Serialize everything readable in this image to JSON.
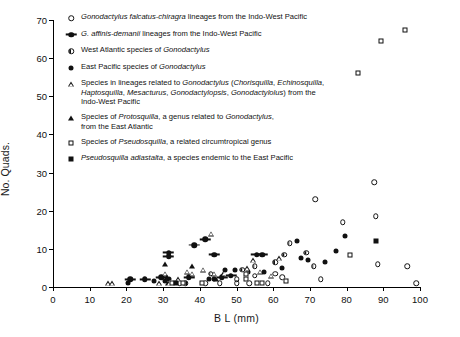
{
  "chart_data": {
    "type": "scatter",
    "title": "",
    "xlabel": "B L (mm)",
    "ylabel": "No. Quads.",
    "xlim": [
      0,
      100
    ],
    "ylim": [
      0,
      70
    ],
    "xticks": [
      0,
      10,
      20,
      30,
      40,
      50,
      60,
      70,
      80,
      90,
      100
    ],
    "yticks": [
      0,
      10,
      20,
      30,
      40,
      50,
      60,
      70
    ],
    "grid": false,
    "legend_position": "upper-left-inside",
    "series": [
      {
        "name": "Gonodactylus falcatus-chiragra lineages from the Indo-West Pacific",
        "marker": "open-circle",
        "points": [
          [
            34.5,
            1.0
          ],
          [
            36.0,
            1.0
          ],
          [
            41.5,
            1.0
          ],
          [
            45.5,
            1.0
          ],
          [
            50.0,
            2.0
          ],
          [
            50.0,
            1.0
          ],
          [
            53.5,
            1.0
          ],
          [
            58.5,
            1.0
          ],
          [
            55.0,
            3.0
          ],
          [
            60.5,
            3.5
          ],
          [
            62.5,
            2.5
          ],
          [
            71.5,
            23.0
          ],
          [
            73.0,
            2.0
          ],
          [
            79.0,
            17.0
          ],
          [
            87.5,
            27.5
          ],
          [
            88.0,
            18.5
          ],
          [
            88.5,
            6.0
          ],
          [
            96.5,
            5.5
          ],
          [
            99.0,
            1.0
          ]
        ]
      },
      {
        "name": "G. affinis-demanii lineages from the Indo-West Pacific",
        "marker": "barred-circle",
        "points": [
          [
            21.0,
            2.0
          ],
          [
            25.0,
            2.0
          ],
          [
            29.5,
            2.5
          ],
          [
            31.5,
            8.0
          ],
          [
            31.5,
            9.0
          ],
          [
            37.0,
            2.5
          ],
          [
            38.5,
            11.0
          ],
          [
            41.5,
            12.5
          ],
          [
            44.0,
            8.5
          ],
          [
            46.0,
            2.5
          ],
          [
            48.5,
            3.0
          ],
          [
            55.5,
            8.5
          ],
          [
            57.0,
            8.5
          ]
        ]
      },
      {
        "name": "West Atlantic species of Gonodactylus",
        "marker": "half-circle",
        "points": [
          [
            43.0,
            3.5
          ],
          [
            51.5,
            4.5
          ],
          [
            55.0,
            5.5
          ],
          [
            60.5,
            6.5
          ],
          [
            63.0,
            8.5
          ],
          [
            64.5,
            11.5
          ],
          [
            69.0,
            9.0
          ],
          [
            71.0,
            5.5
          ]
        ]
      },
      {
        "name": "East Pacific species of Gonodactylus",
        "marker": "filled-circle",
        "points": [
          [
            20.5,
            1.0
          ],
          [
            27.5,
            1.5
          ],
          [
            30.5,
            1.5
          ],
          [
            31.5,
            2.0
          ],
          [
            36.0,
            1.0
          ],
          [
            42.5,
            2.0
          ],
          [
            44.0,
            2.0
          ],
          [
            47.0,
            4.5
          ],
          [
            49.5,
            4.5
          ],
          [
            53.0,
            4.0
          ],
          [
            57.5,
            4.0
          ],
          [
            62.5,
            5.0
          ],
          [
            66.5,
            12.0
          ],
          [
            67.5,
            7.5
          ],
          [
            69.5,
            7.0
          ],
          [
            74.0,
            6.5
          ],
          [
            77.0,
            9.5
          ],
          [
            79.5,
            13.5
          ]
        ]
      },
      {
        "name": "Species in lineages related to Gonodactylus (Chorisquilla, Echinosquilla, Haptosquilla, Mesacturus, Gonodactylopsis, Gonodactylolus) from the Indo-West Pacific",
        "marker": "open-triangle",
        "points": [
          [
            15.0,
            1.0
          ],
          [
            16.0,
            1.0
          ],
          [
            29.0,
            1.0
          ],
          [
            30.5,
            3.5
          ],
          [
            31.5,
            1.0
          ],
          [
            34.0,
            2.0
          ],
          [
            36.5,
            4.0
          ],
          [
            38.0,
            3.5
          ],
          [
            41.0,
            4.5
          ],
          [
            43.0,
            14.0
          ],
          [
            44.0,
            3.5
          ],
          [
            46.5,
            3.5
          ],
          [
            53.0,
            5.0
          ],
          [
            54.5,
            7.0
          ],
          [
            56.5,
            4.0
          ],
          [
            59.5,
            3.0
          ],
          [
            61.5,
            7.5
          ]
        ]
      },
      {
        "name": "Species of Protosquilla, a genus related to Gonodactylus, from the East Atlantic",
        "marker": "filled-triangle",
        "points": [
          [
            30.5,
            6.0
          ],
          [
            31.0,
            2.5
          ],
          [
            38.0,
            5.5
          ],
          [
            44.5,
            2.0
          ]
        ]
      },
      {
        "name": "Species of Pseudosquilla, a related circumtropical genus",
        "marker": "open-square",
        "points": [
          [
            32.5,
            1.0
          ],
          [
            35.5,
            1.0
          ],
          [
            40.5,
            1.0
          ],
          [
            52.5,
            3.5
          ],
          [
            52.5,
            2.0
          ],
          [
            55.5,
            1.0
          ],
          [
            57.0,
            1.0
          ],
          [
            63.5,
            1.5
          ],
          [
            81.0,
            8.5
          ],
          [
            83.0,
            56.0
          ],
          [
            89.5,
            64.5
          ],
          [
            96.0,
            67.5
          ]
        ]
      },
      {
        "name": "Pseudosquilla adiastalta, a species endemic to the East Pacific",
        "marker": "filled-square",
        "points": [
          [
            33.5,
            1.0
          ],
          [
            88.0,
            12.0
          ]
        ]
      }
    ]
  },
  "axes": {
    "x_title": "B L (mm)",
    "y_title": "No. Quads.",
    "x_ticklabels": [
      "0",
      "10",
      "20",
      "30",
      "40",
      "50",
      "60",
      "70",
      "80",
      "90",
      "100"
    ],
    "y_ticklabels": [
      "0",
      "10",
      "20",
      "30",
      "40",
      "50",
      "60",
      "70"
    ]
  },
  "legend": {
    "entries": [
      {
        "marker": "open-circle",
        "text": "Gonodactylus falcatus-chiragra lineages from the Indo-West Pacific"
      },
      {
        "marker": "barred-circle",
        "text": "G. affinis-demanii lineages from the Indo-West Pacific"
      },
      {
        "marker": "half-circle",
        "text": "West Atlantic species of Gonodactylus"
      },
      {
        "marker": "filled-circle",
        "text": "East Pacific species of Gonodactylus"
      },
      {
        "marker": "open-triangle",
        "text": "Species in lineages related to Gonodactylus (Chorisquilla, Echinosquilla,\n      Haptosquilla, Mesacturus, Gonodactylopsis, Gonodactylolus) from the\n      Indo-West Pacific"
      },
      {
        "marker": "filled-triangle",
        "text": "Species of Protosquilla, a genus related to Gonodactylus,\n      from the East Atlantic"
      },
      {
        "marker": "open-square",
        "text": "Species of Pseudosquilla, a related circumtropical genus"
      },
      {
        "marker": "filled-square",
        "text": "Pseudosquilla adiastalta, a species endemic to the East Pacific"
      }
    ]
  }
}
